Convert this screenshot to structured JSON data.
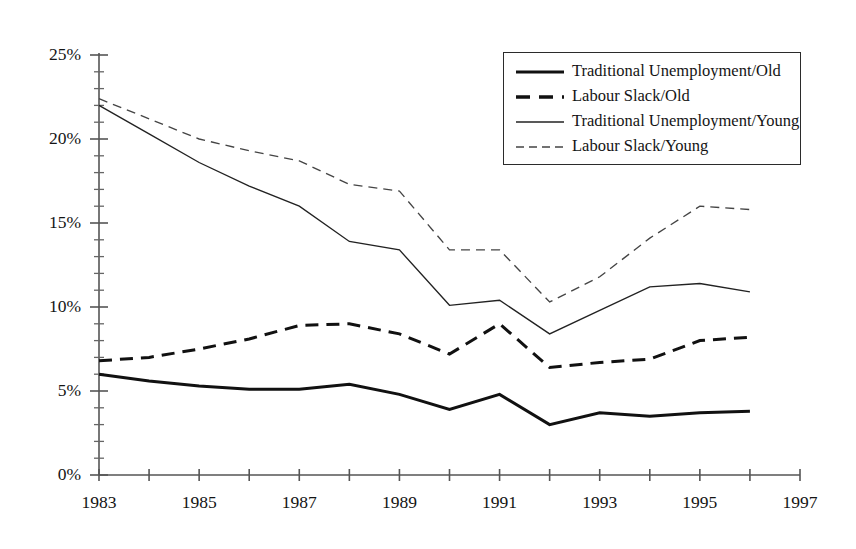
{
  "chart_data": {
    "type": "line",
    "title": "",
    "subtitle": "",
    "xlabel": "",
    "ylabel": "",
    "xlim": [
      1983,
      1997
    ],
    "ylim": [
      0,
      25
    ],
    "yticks": [
      "0%",
      "5%",
      "10%",
      "15%",
      "20%",
      "25%"
    ],
    "ytick_values": [
      0,
      5,
      10,
      15,
      20,
      25
    ],
    "ytick_minor_step": 1,
    "xticks": [
      "1983",
      "1985",
      "1987",
      "1989",
      "1991",
      "1993",
      "1995",
      "1997"
    ],
    "xtick_values": [
      1983,
      1985,
      1987,
      1989,
      1991,
      1993,
      1995,
      1997
    ],
    "xtick_minor_step": 1,
    "grid": false,
    "legend_position": "top-right",
    "x": [
      1983,
      1984,
      1985,
      1986,
      1987,
      1988,
      1989,
      1990,
      1991,
      1992,
      1993,
      1994,
      1995,
      1996
    ],
    "series": [
      {
        "name": "Traditional Unemployment/Old",
        "style": "thick-solid",
        "values": [
          6.0,
          5.6,
          5.3,
          5.1,
          5.1,
          5.4,
          4.8,
          3.9,
          4.8,
          3.0,
          3.7,
          3.5,
          3.7,
          3.8
        ]
      },
      {
        "name": "Labour Slack/Old",
        "style": "thick-dashed",
        "values": [
          6.8,
          7.0,
          7.5,
          8.1,
          8.9,
          9.0,
          8.4,
          7.2,
          9.0,
          6.4,
          6.7,
          6.9,
          8.0,
          8.2
        ]
      },
      {
        "name": "Traditional Unemployment/Young",
        "style": "thin-solid",
        "values": [
          22.0,
          20.3,
          18.6,
          17.2,
          16.0,
          13.9,
          13.4,
          10.1,
          10.4,
          8.4,
          9.8,
          11.2,
          11.4,
          10.9
        ]
      },
      {
        "name": "Labour Slack/Young",
        "style": "thin-dashed",
        "values": [
          22.4,
          21.2,
          20.0,
          19.3,
          18.7,
          17.3,
          16.9,
          13.4,
          13.4,
          10.3,
          11.8,
          14.1,
          16.0,
          15.8
        ]
      }
    ]
  },
  "legend": {
    "entries": [
      {
        "label": "Traditional Unemployment/Old",
        "style": "thick-solid"
      },
      {
        "label": "Labour Slack/Old",
        "style": "thick-dashed"
      },
      {
        "label": "Traditional Unemployment/Young",
        "style": "thin-solid"
      },
      {
        "label": "Labour Slack/Young",
        "style": "thin-dashed"
      }
    ]
  },
  "colors": {
    "line": "#111111",
    "axis": "#555555",
    "text": "#141414",
    "background": "#ffffff"
  }
}
